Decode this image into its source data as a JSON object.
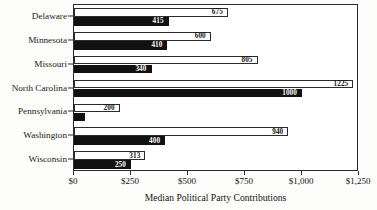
{
  "chart_data": {
    "type": "bar",
    "orientation": "horizontal",
    "title": "",
    "title_cropped": true,
    "xlabel": "Median Political Party Contributions",
    "ylabel": "",
    "xlim": [
      0,
      1250
    ],
    "grid": false,
    "legend": "none",
    "categories": [
      "Delaware",
      "Minnesota",
      "Missouri",
      "North Carolina",
      "Pennsylvania",
      "Washington",
      "Wisconsin"
    ],
    "series": [
      {
        "name": "upper",
        "style": "light",
        "values": [
          675,
          600,
          805,
          1225,
          200,
          940,
          313
        ],
        "labels": [
          "675",
          "600",
          "805",
          "1225",
          "200",
          "940",
          "313"
        ]
      },
      {
        "name": "lower",
        "style": "dark",
        "values": [
          415,
          410,
          340,
          1000,
          50,
          400,
          250
        ],
        "labels": [
          "415",
          "410",
          "340",
          "1000",
          "",
          "400",
          "250"
        ]
      }
    ],
    "xticks": [
      0,
      250,
      500,
      750,
      1000,
      1250
    ],
    "xtick_labels": [
      "$0",
      "$250",
      "$500",
      "$750",
      "$1,000",
      "$1,250"
    ]
  },
  "colors": {
    "light_bar_fill": "#ffffff",
    "dark_bar_fill": "#111111",
    "outline": "#2b2b2b",
    "text": "#141414",
    "background": "#fdfdfc"
  }
}
